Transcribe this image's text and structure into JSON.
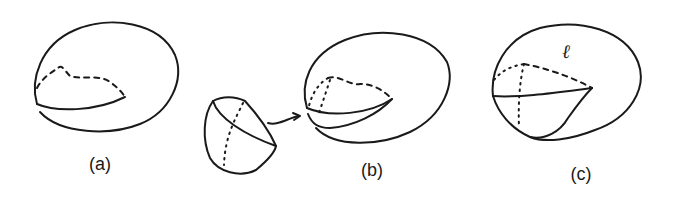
{
  "figure": {
    "stroke_color": "#1a1a1a",
    "background": "#ffffff",
    "panels": [
      {
        "id": "a",
        "label": "(a)"
      },
      {
        "id": "b",
        "label": "(b)"
      },
      {
        "id": "c",
        "label": "(c)",
        "annotation": "ℓ"
      }
    ]
  }
}
